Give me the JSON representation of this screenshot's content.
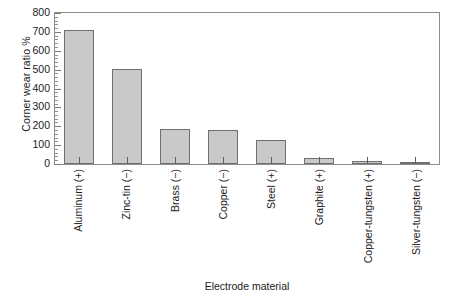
{
  "chart_data": {
    "type": "bar",
    "title": "",
    "xlabel": "Electrode material",
    "ylabel": "Corner wear ratio %",
    "ylim": [
      0,
      800
    ],
    "ytick_step": 100,
    "yminor_step": 20,
    "grid": false,
    "legend": "none",
    "bar_fill_color": "#c9c9c9",
    "bar_border_color": "#6f6f6f",
    "axis_color": "#8d8d8d",
    "categories": [
      "Aluminum (+)",
      "Zinc-tin (−)",
      "Brass (−)",
      "Copper (−)",
      "Steel (+)",
      "Graphite (+)",
      "Copper-tungsten (+)",
      "Silver-tungsten (−)"
    ],
    "values": [
      712,
      502,
      186,
      182,
      125,
      30,
      18,
      8
    ],
    "ytick_labels": [
      "800",
      "700",
      "600",
      "500",
      "400",
      "300",
      "200",
      "100",
      "0"
    ],
    "ytick_values": [
      800,
      700,
      600,
      500,
      400,
      300,
      200,
      100,
      0
    ]
  }
}
